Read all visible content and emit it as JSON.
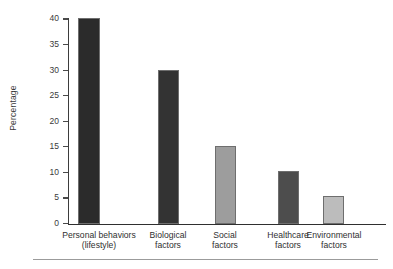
{
  "chart_data": {
    "type": "bar",
    "title": "",
    "subtitle": "",
    "xlabel": "",
    "ylabel": "Percentage",
    "categories": [
      "Personal behaviors\n(lifestyle)",
      "Biological\nfactors",
      "Social\nfactors",
      "Healthcare\nfactors",
      "Environmental\nfactors"
    ],
    "values": [
      40.2,
      30.2,
      15.3,
      10.3,
      5.5
    ],
    "bar_colors": [
      "#2b2b2b",
      "#333333",
      "#9d9d9d",
      "#4d4d4d",
      "#bcbcbc"
    ],
    "ylim": [
      0,
      40
    ],
    "yticks": [
      0,
      5,
      10,
      15,
      20,
      25,
      30,
      35,
      40
    ],
    "ytick_labels": [
      "0",
      "5",
      "10",
      "15",
      "20",
      "25",
      "30",
      "35",
      "40"
    ],
    "grid": false,
    "legend": false,
    "legend_position": "none",
    "axis_color": "#2f2f2f",
    "bar_edge_color": "#6e6e6e",
    "background_color": "#ffffff"
  },
  "figure": {
    "rule_color": "#9b9b9b"
  }
}
